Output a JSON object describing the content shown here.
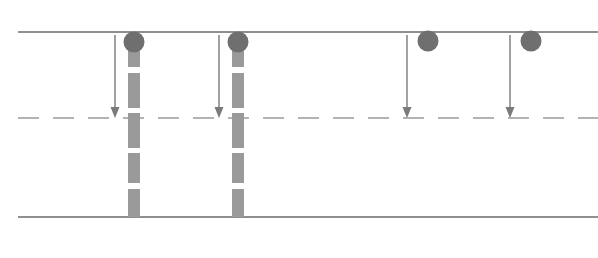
{
  "diagram": {
    "type": "road-schematic",
    "canvas": {
      "width": 598,
      "height": 258,
      "background": "#ffffff"
    },
    "colors": {
      "road_line": "#8f8f8f",
      "center_dash": "#9a9a9a",
      "vehicle": "#6f6f6f",
      "trajectory": "#9a9a9a",
      "arrow": "#7a7a7a"
    },
    "road": {
      "top_edge": {
        "label": "top-road-edge",
        "y": 32,
        "x1": 18,
        "x2": 598,
        "stroke_width": 2.2
      },
      "bottom_edge": {
        "label": "bottom-road-edge",
        "y": 217,
        "x1": 18,
        "x2": 598,
        "stroke_width": 2.2
      },
      "center_line": {
        "label": "lane-divider-dashed",
        "y": 118,
        "x1": 18,
        "x2": 598,
        "stroke_width": 1.6,
        "dash": 21,
        "gap": 14
      }
    },
    "vehicles": [
      {
        "id": "vehicle-1",
        "cx": 134,
        "cy": 42,
        "r": 10.5
      },
      {
        "id": "vehicle-2",
        "cx": 238,
        "cy": 42,
        "r": 10.5
      },
      {
        "id": "vehicle-3",
        "cx": 428,
        "cy": 41,
        "r": 10.5
      },
      {
        "id": "vehicle-4",
        "cx": 531,
        "cy": 41,
        "r": 10.5
      }
    ],
    "arrows": [
      {
        "id": "arrow-1",
        "x": 115,
        "y1": 35,
        "y2": 118,
        "stroke_width": 1.4,
        "head_width": 9,
        "head_height": 11
      },
      {
        "id": "arrow-2",
        "x": 219,
        "y1": 35,
        "y2": 118,
        "stroke_width": 1.4,
        "head_width": 9,
        "head_height": 11
      },
      {
        "id": "arrow-3",
        "x": 407,
        "y1": 35,
        "y2": 118,
        "stroke_width": 1.4,
        "head_width": 9,
        "head_height": 11
      },
      {
        "id": "arrow-4",
        "x": 510,
        "y1": 35,
        "y2": 118,
        "stroke_width": 1.4,
        "head_width": 9,
        "head_height": 11
      }
    ],
    "trajectories": [
      {
        "id": "trajectory-1",
        "x": 134,
        "width": 12,
        "segments": [
          {
            "y": 45,
            "h": 22
          },
          {
            "y": 73,
            "h": 35
          },
          {
            "y": 113,
            "h": 35
          },
          {
            "y": 153,
            "h": 30
          },
          {
            "y": 189,
            "h": 28
          }
        ]
      },
      {
        "id": "trajectory-2",
        "x": 238,
        "width": 12,
        "segments": [
          {
            "y": 45,
            "h": 22
          },
          {
            "y": 73,
            "h": 35
          },
          {
            "y": 113,
            "h": 35
          },
          {
            "y": 153,
            "h": 30
          },
          {
            "y": 189,
            "h": 28
          }
        ]
      }
    ]
  }
}
